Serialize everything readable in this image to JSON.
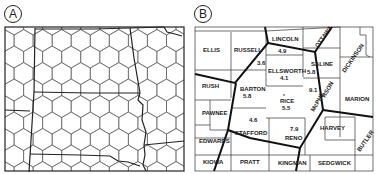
{
  "panels": {
    "a": {
      "label": "A"
    },
    "b": {
      "label": "B"
    }
  },
  "counties": {
    "ellis": "ELLIS",
    "russell": "RUSSELL",
    "lincoln": "LINCOLN",
    "ottawa": "OTTAWA",
    "dickinson": "DICKINSON",
    "saline": "SALINE",
    "ellsworth": "ELLSWORTH",
    "rush": "RUSH",
    "barton": "BARTON",
    "rice": "RICE",
    "mcpherson_a": "McPHE",
    "mcpherson_b": "RSON",
    "marion": "MARION",
    "pawnee": "PAWNEE",
    "stafford": "STAFFORD",
    "reno": "RENO",
    "harvey": "HARVEY",
    "butler": "BUTLER",
    "edwards": "EDWARDS",
    "kiowa": "KIOWA",
    "pratt": "PRATT",
    "kingman": "KINGMAN",
    "sedgwick": "SEDGWICK"
  },
  "values": {
    "lincoln": "4.9",
    "russell": "3.6",
    "ellsworth": "4.1",
    "saline": "5.8",
    "mcpherson": "9.1",
    "barton": "5.8",
    "rice": "5.5",
    "stafford": "4.6",
    "reno": "7.9"
  }
}
